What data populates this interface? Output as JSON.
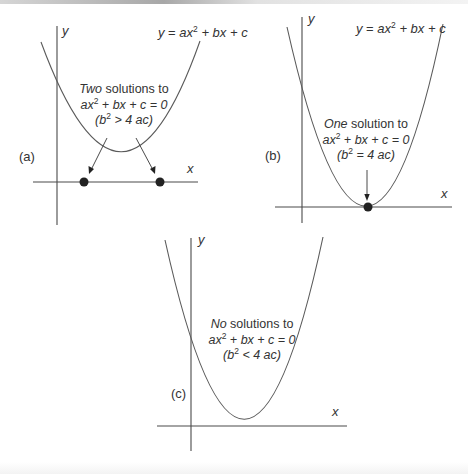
{
  "figure": {
    "panels": [
      {
        "id": "a",
        "panel_label": "(a)",
        "axis_x_label": "x",
        "axis_y_label": "y",
        "equation_label": {
          "lhs": "y",
          "eq": " = ",
          "a": "ax",
          "exp": "2",
          "rest": " + bx + c"
        },
        "annotation": {
          "emph": "Two",
          "line1_rest": " solutions to",
          "line2_pre": "ax",
          "line2_exp": "2",
          "line2_rest": " + bx + c = 0",
          "line3_open": "(b",
          "line3_exp": "2",
          "line3_rest": " > 4 ac)"
        },
        "roots": 2,
        "discriminant_relation": "b^2 > 4ac"
      },
      {
        "id": "b",
        "panel_label": "(b)",
        "axis_x_label": "x",
        "axis_y_label": "y",
        "equation_label": {
          "lhs": "y",
          "eq": " = ",
          "a": "ax",
          "exp": "2",
          "rest": " + bx + c"
        },
        "annotation": {
          "emph": "One",
          "line1_rest": " solution to",
          "line2_pre": "ax",
          "line2_exp": "2",
          "line2_rest": " + bx + c = 0",
          "line3_open": "(b",
          "line3_exp": "2",
          "line3_rest": " = 4 ac)"
        },
        "roots": 1,
        "discriminant_relation": "b^2 = 4ac"
      },
      {
        "id": "c",
        "panel_label": "(c)",
        "axis_x_label": "x",
        "axis_y_label": "y",
        "annotation": {
          "emph": "No",
          "line1_rest": " solutions to",
          "line2_pre": "ax",
          "line2_exp": "2",
          "line2_rest": " + bx + c = 0",
          "line3_open": "(b",
          "line3_exp": "2",
          "line3_rest": " < 4 ac)"
        },
        "roots": 0,
        "discriminant_relation": "b^2 < 4ac"
      }
    ],
    "colors": {
      "axis": "#4a4a4a",
      "curve": "#5a5a5a",
      "dot": "#222222",
      "text": "#333333",
      "background": "#ffffff"
    }
  }
}
